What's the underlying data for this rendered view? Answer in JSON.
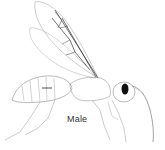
{
  "figure": {
    "caption": "Male"
  }
}
